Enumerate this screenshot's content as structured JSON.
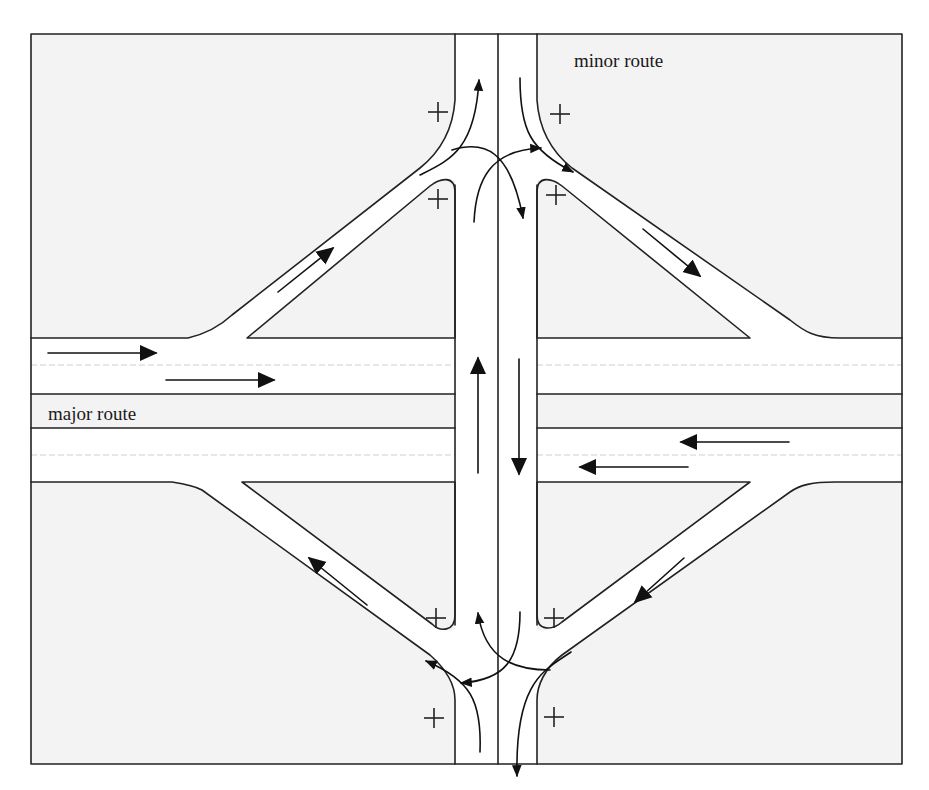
{
  "diagram": {
    "labels": {
      "minor_route": "minor route",
      "major_route": "major route"
    },
    "colors": {
      "land": "#f3f3f3",
      "road": "#ffffff",
      "edge": "#222222",
      "arrow": "#111111",
      "lane_dash": "#cfcfcf"
    },
    "conflict_markers": {
      "symbol": "+",
      "count": 8,
      "positions": [
        "north-west outer",
        "north-west inner",
        "north-east outer",
        "north-east inner",
        "south-west inner",
        "south-west outer",
        "south-east inner",
        "south-east outer"
      ]
    },
    "traffic_flows": [
      {
        "id": "major-eastbound-lane1",
        "direction": "east"
      },
      {
        "id": "major-eastbound-lane2",
        "direction": "east"
      },
      {
        "id": "major-westbound-lane1",
        "direction": "west"
      },
      {
        "id": "major-westbound-lane2",
        "direction": "west"
      },
      {
        "id": "nw-on-ramp",
        "direction": "north-east"
      },
      {
        "id": "ne-off-ramp",
        "direction": "south-east"
      },
      {
        "id": "se-on-ramp",
        "direction": "south-west"
      },
      {
        "id": "sw-off-ramp",
        "direction": "north-west"
      },
      {
        "id": "minor-northbound",
        "direction": "north"
      },
      {
        "id": "minor-southbound",
        "direction": "south"
      },
      {
        "id": "north-terminal-turns",
        "direction": "mixed"
      },
      {
        "id": "south-terminal-turns",
        "direction": "mixed"
      }
    ]
  }
}
